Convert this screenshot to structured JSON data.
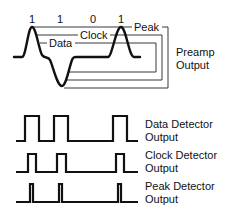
{
  "bits": [
    "1",
    "1",
    "0",
    "1"
  ],
  "preamp": {
    "inline_labels": {
      "peak": "Peak",
      "clock": "Clock",
      "data": "Data"
    },
    "output_label_line1": "Preamp",
    "output_label_line2": "Output"
  },
  "detectors": [
    {
      "line1": "Data Detector",
      "line2": "Output"
    },
    {
      "line1": "Clock Detector",
      "line2": "Output"
    },
    {
      "line1": "Peak Detector",
      "line2": "Output"
    }
  ],
  "colors": {
    "ink": "#111111",
    "background": "#ffffff"
  }
}
